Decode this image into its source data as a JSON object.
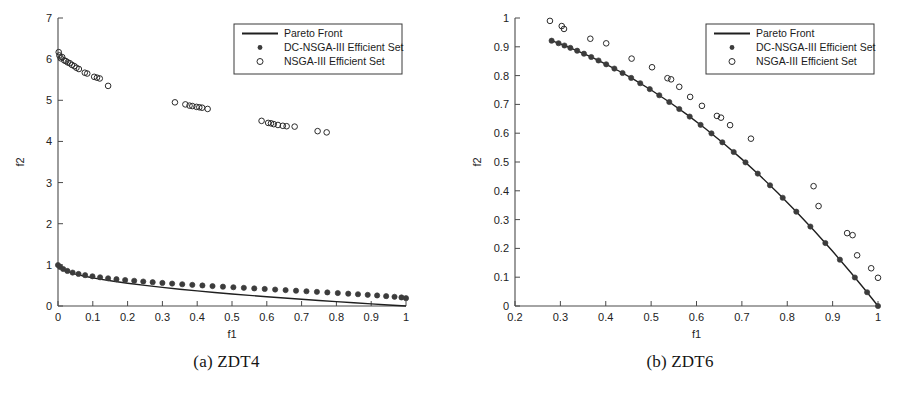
{
  "figure": {
    "panels": [
      {
        "id": "a",
        "caption": "(a) ZDT4",
        "chart": {
          "type": "scatter",
          "title": "",
          "xlabel": "f1",
          "ylabel": "f2",
          "xlim": [
            0,
            1
          ],
          "ylim": [
            0,
            7
          ],
          "xticks": [
            "0",
            "0.1",
            "0.2",
            "0.3",
            "0.4",
            "0.5",
            "0.6",
            "0.7",
            "0.8",
            "0.9",
            "1"
          ],
          "yticks": [
            "0",
            "1",
            "2",
            "3",
            "4",
            "5",
            "6",
            "7"
          ],
          "grid": false,
          "legend_position": "top-right",
          "legend": [
            "Pareto Front",
            "DC-NSGA-III Efficient Set",
            "NSGA-III Efficient Set"
          ],
          "series": [
            {
              "name": "Pareto Front",
              "style": "line",
              "color": "#1f1f1f",
              "x": [
                0,
                0.02,
                0.05,
                0.08,
                0.12,
                0.16,
                0.2,
                0.25,
                0.3,
                0.35,
                0.4,
                0.45,
                0.5,
                0.55,
                0.6,
                0.65,
                0.7,
                0.75,
                0.8,
                0.85,
                0.9,
                0.95,
                1
              ],
              "y": [
                1,
                0.859,
                0.776,
                0.717,
                0.654,
                0.6,
                0.553,
                0.5,
                0.452,
                0.408,
                0.368,
                0.329,
                0.293,
                0.258,
                0.225,
                0.194,
                0.163,
                0.134,
                0.106,
                0.078,
                0.051,
                0.025,
                0
              ]
            },
            {
              "name": "DC-NSGA-III Efficient Set",
              "style": "filled-circle",
              "color": "#3c3c3c",
              "x": [
                0.0,
                0.006,
                0.015,
                0.027,
                0.042,
                0.059,
                0.078,
                0.099,
                0.121,
                0.144,
                0.168,
                0.193,
                0.219,
                0.245,
                0.272,
                0.3,
                0.328,
                0.357,
                0.386,
                0.415,
                0.444,
                0.474,
                0.504,
                0.534,
                0.564,
                0.594,
                0.624,
                0.654,
                0.684,
                0.714,
                0.744,
                0.774,
                0.804,
                0.834,
                0.862,
                0.89,
                0.917,
                0.943,
                0.967,
                0.987,
                1.0
              ],
              "y": [
                0.995,
                0.95,
                0.899,
                0.852,
                0.812,
                0.779,
                0.749,
                0.722,
                0.697,
                0.673,
                0.652,
                0.632,
                0.613,
                0.595,
                0.578,
                0.561,
                0.545,
                0.529,
                0.514,
                0.499,
                0.484,
                0.47,
                0.456,
                0.442,
                0.428,
                0.414,
                0.4,
                0.386,
                0.372,
                0.358,
                0.344,
                0.33,
                0.315,
                0.3,
                0.286,
                0.271,
                0.256,
                0.24,
                0.224,
                0.208,
                0.19
              ]
            },
            {
              "name": "NSGA-III Efficient Set",
              "style": "open-circle",
              "color": "#2a2a2a",
              "x": [
                0.002,
                0.004,
                0.008,
                0.012,
                0.018,
                0.023,
                0.028,
                0.034,
                0.04,
                0.047,
                0.053,
                0.06,
                0.077,
                0.084,
                0.104,
                0.112,
                0.12,
                0.144,
                0.336,
                0.366,
                0.378,
                0.386,
                0.398,
                0.406,
                0.414,
                0.43,
                0.585,
                0.604,
                0.612,
                0.62,
                0.632,
                0.646,
                0.657,
                0.68,
                0.746,
                0.772
              ],
              "y": [
                6.17,
                6.09,
                6.02,
                6.05,
                5.97,
                5.95,
                5.92,
                5.9,
                5.86,
                5.83,
                5.79,
                5.76,
                5.67,
                5.65,
                5.57,
                5.55,
                5.53,
                5.35,
                4.95,
                4.9,
                4.87,
                4.86,
                4.84,
                4.83,
                4.82,
                4.79,
                4.5,
                4.45,
                4.44,
                4.42,
                4.4,
                4.38,
                4.37,
                4.36,
                4.25,
                4.22
              ]
            }
          ]
        }
      },
      {
        "id": "b",
        "caption": "(b) ZDT6",
        "chart": {
          "type": "scatter",
          "title": "",
          "xlabel": "f1",
          "ylabel": "f2",
          "xlim": [
            0.2,
            1
          ],
          "ylim": [
            0,
            1
          ],
          "xticks": [
            "0.2",
            "0.3",
            "0.4",
            "0.5",
            "0.6",
            "0.7",
            "0.8",
            "0.9",
            "1"
          ],
          "yticks": [
            "0",
            "0.1",
            "0.2",
            "0.3",
            "0.4",
            "0.5",
            "0.6",
            "0.7",
            "0.8",
            "0.9",
            "1"
          ],
          "grid": false,
          "legend_position": "top-right",
          "legend": [
            "Pareto Front",
            "DC-NSGA-III Efficient Set",
            "NSGA-III Efficient Set"
          ],
          "series": [
            {
              "name": "Pareto Front",
              "style": "line",
              "color": "#1f1f1f",
              "x": [
                0.2807,
                0.31,
                0.34,
                0.37,
                0.4,
                0.43,
                0.46,
                0.5,
                0.54,
                0.58,
                0.62,
                0.66,
                0.7,
                0.74,
                0.78,
                0.82,
                0.86,
                0.9,
                0.94,
                0.97,
                1.0
              ],
              "y": [
                0.9212,
                0.9039,
                0.8844,
                0.8631,
                0.84,
                0.8151,
                0.7884,
                0.75,
                0.7084,
                0.6636,
                0.6156,
                0.5644,
                0.51,
                0.4524,
                0.3916,
                0.3276,
                0.2604,
                0.19,
                0.1164,
                0.0591,
                0.0
              ]
            },
            {
              "name": "DC-NSGA-III Efficient Set",
              "style": "filled-circle",
              "color": "#3c3c3c",
              "x": [
                0.2807,
                0.296,
                0.309,
                0.322,
                0.337,
                0.352,
                0.368,
                0.384,
                0.401,
                0.419,
                0.437,
                0.456,
                0.476,
                0.497,
                0.518,
                0.54,
                0.562,
                0.585,
                0.609,
                0.633,
                0.657,
                0.682,
                0.708,
                0.735,
                0.762,
                0.79,
                0.82,
                0.851,
                0.884,
                0.916,
                0.949,
                0.976,
                1.0
              ],
              "y": [
                0.9212,
                0.9124,
                0.9045,
                0.8963,
                0.8864,
                0.8761,
                0.8646,
                0.8525,
                0.8392,
                0.8244,
                0.8091,
                0.7921,
                0.7735,
                0.7531,
                0.7317,
                0.7084,
                0.6841,
                0.6577,
                0.629,
                0.5994,
                0.5684,
                0.5348,
                0.4987,
                0.4597,
                0.4191,
                0.3759,
                0.3276,
                0.2759,
                0.2186,
                0.1609,
                0.099,
                0.0478,
                0.0
              ]
            },
            {
              "name": "NSGA-III Efficient Set",
              "style": "open-circle",
              "color": "#2a2a2a",
              "x": [
                0.277,
                0.303,
                0.308,
                0.366,
                0.401,
                0.457,
                0.502,
                0.536,
                0.544,
                0.562,
                0.586,
                0.612,
                0.645,
                0.654,
                0.674,
                0.72,
                0.858,
                0.869,
                0.932,
                0.944,
                0.954,
                0.985,
                1.0
              ],
              "y": [
                0.99,
                0.972,
                0.962,
                0.928,
                0.912,
                0.859,
                0.829,
                0.791,
                0.787,
                0.761,
                0.726,
                0.695,
                0.66,
                0.654,
                0.628,
                0.581,
                0.416,
                0.347,
                0.253,
                0.246,
                0.176,
                0.131,
                0.098
              ]
            }
          ]
        }
      }
    ]
  }
}
